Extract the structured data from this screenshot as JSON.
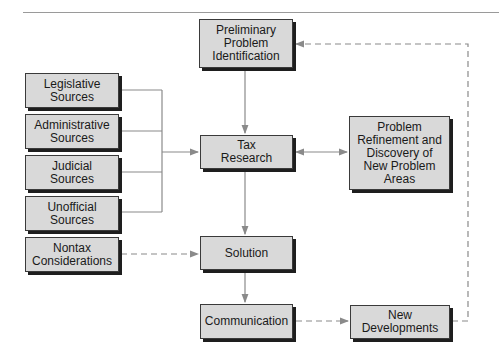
{
  "colors": {
    "box_fill": "#d9d9d9",
    "box_border": "#3a3a3a",
    "shadow": "#1e1e1e",
    "connector": "#8a8a8a"
  },
  "nodes": {
    "preliminary": "Preliminary\nProblem\nIdentification",
    "tax_research": "Tax\nResearch",
    "problem_refinement": "Problem\nRefinement and\nDiscovery of\nNew Problem\nAreas",
    "solution": "Solution",
    "communication": "Communication",
    "new_developments": "New\nDevelopments",
    "legislative": "Legislative\nSources",
    "administrative": "Administrative\nSources",
    "judicial": "Judicial\nSources",
    "unofficial": "Unofficial\nSources",
    "nontax": "Nontax\nConsiderations"
  },
  "edges": [
    {
      "from": "preliminary",
      "to": "tax_research",
      "style": "solid"
    },
    {
      "from": "sources",
      "to": "tax_research",
      "style": "solid"
    },
    {
      "from": "tax_research",
      "to": "problem_refinement",
      "style": "solid",
      "bidirectional": true
    },
    {
      "from": "tax_research",
      "to": "solution",
      "style": "solid"
    },
    {
      "from": "nontax",
      "to": "solution",
      "style": "dashed"
    },
    {
      "from": "solution",
      "to": "communication",
      "style": "solid"
    },
    {
      "from": "communication",
      "to": "new_developments",
      "style": "dashed"
    },
    {
      "from": "new_developments",
      "to": "preliminary",
      "style": "dashed"
    }
  ]
}
